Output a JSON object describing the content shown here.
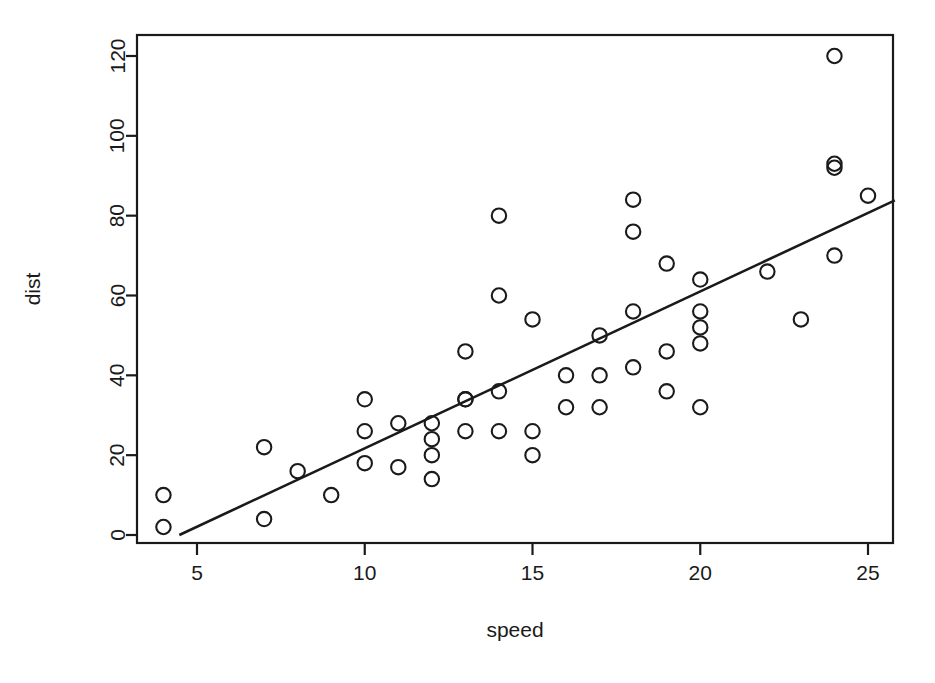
{
  "chart_data": {
    "type": "scatter",
    "title": "",
    "xlabel": "speed",
    "ylabel": "dist",
    "xlim": [
      3.4,
      25.8
    ],
    "ylim": [
      -6,
      126
    ],
    "grid": false,
    "legend": null,
    "xticks": [
      5,
      10,
      15,
      20,
      25
    ],
    "xtick_labels": [
      "5",
      "10",
      "15",
      "20",
      "25"
    ],
    "yticks": [
      0,
      20,
      40,
      60,
      80,
      100,
      120
    ],
    "ytick_labels": [
      "0",
      "20",
      "40",
      "60",
      "80",
      "100",
      "120"
    ],
    "marker": "open-circle",
    "marker_color": "#1a1a1a",
    "points": [
      {
        "x": 4,
        "y": 2
      },
      {
        "x": 4,
        "y": 10
      },
      {
        "x": 7,
        "y": 4
      },
      {
        "x": 7,
        "y": 22
      },
      {
        "x": 8,
        "y": 16
      },
      {
        "x": 9,
        "y": 10
      },
      {
        "x": 10,
        "y": 18
      },
      {
        "x": 10,
        "y": 26
      },
      {
        "x": 10,
        "y": 34
      },
      {
        "x": 11,
        "y": 17
      },
      {
        "x": 11,
        "y": 28
      },
      {
        "x": 12,
        "y": 14
      },
      {
        "x": 12,
        "y": 20
      },
      {
        "x": 12,
        "y": 24
      },
      {
        "x": 12,
        "y": 28
      },
      {
        "x": 13,
        "y": 26
      },
      {
        "x": 13,
        "y": 34
      },
      {
        "x": 13,
        "y": 34
      },
      {
        "x": 13,
        "y": 46
      },
      {
        "x": 14,
        "y": 26
      },
      {
        "x": 14,
        "y": 36
      },
      {
        "x": 14,
        "y": 60
      },
      {
        "x": 14,
        "y": 80
      },
      {
        "x": 15,
        "y": 20
      },
      {
        "x": 15,
        "y": 26
      },
      {
        "x": 15,
        "y": 54
      },
      {
        "x": 16,
        "y": 32
      },
      {
        "x": 16,
        "y": 40
      },
      {
        "x": 17,
        "y": 32
      },
      {
        "x": 17,
        "y": 40
      },
      {
        "x": 17,
        "y": 50
      },
      {
        "x": 18,
        "y": 42
      },
      {
        "x": 18,
        "y": 56
      },
      {
        "x": 18,
        "y": 76
      },
      {
        "x": 18,
        "y": 84
      },
      {
        "x": 19,
        "y": 36
      },
      {
        "x": 19,
        "y": 46
      },
      {
        "x": 19,
        "y": 68
      },
      {
        "x": 20,
        "y": 32
      },
      {
        "x": 20,
        "y": 48
      },
      {
        "x": 20,
        "y": 52
      },
      {
        "x": 20,
        "y": 56
      },
      {
        "x": 20,
        "y": 64
      },
      {
        "x": 22,
        "y": 66
      },
      {
        "x": 23,
        "y": 54
      },
      {
        "x": 24,
        "y": 70
      },
      {
        "x": 24,
        "y": 92
      },
      {
        "x": 24,
        "y": 93
      },
      {
        "x": 24,
        "y": 120
      },
      {
        "x": 25,
        "y": 85
      }
    ],
    "fit_line": {
      "type": "linear-regression",
      "intercept": -17.58,
      "slope": 3.93,
      "x_start": 3.4,
      "x_end": 25.8
    }
  }
}
